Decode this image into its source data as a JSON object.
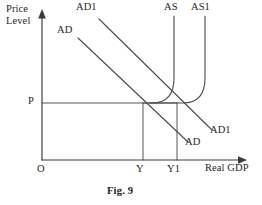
{
  "figure": {
    "caption": "Fig. 9",
    "caption_x": 106,
    "caption_y": 186,
    "width": 262,
    "height": 205,
    "background_color": "#ffffff",
    "line_color": "#4a4a4a",
    "text_color": "#262626"
  },
  "axes": {
    "y_title_line1": "Price",
    "y_title_line2": "Level",
    "y_title_x": 6,
    "y_title_y": 5,
    "x_title": "Real GDP",
    "x_title_x": 208,
    "x_title_y": 163,
    "origin_label": "O",
    "origin_label_x": 37,
    "origin_label_y": 165,
    "x_axis_y": 160,
    "y_axis_x": 42,
    "y_axis_top": 16,
    "x_axis_right": 246
  },
  "tick_labels": [
    {
      "name": "price-level-p",
      "text": "P",
      "x": 29,
      "y": 96
    },
    {
      "name": "output-y",
      "text": "Y",
      "x": 136,
      "y": 165
    },
    {
      "name": "output-y1",
      "text": "Y1",
      "x": 168,
      "y": 165
    }
  ],
  "curve_labels": [
    {
      "name": "ad1-label-top",
      "text": "AD1",
      "x": 76,
      "y": 2
    },
    {
      "name": "ad-label-top",
      "text": "AD",
      "x": 57,
      "y": 25
    },
    {
      "name": "as-label",
      "text": "AS",
      "x": 164,
      "y": 2
    },
    {
      "name": "as1-label",
      "text": "AS1",
      "x": 192,
      "y": 2
    },
    {
      "name": "ad1-label-bottom",
      "text": "AD1",
      "x": 211,
      "y": 125
    },
    {
      "name": "ad-label-bottom",
      "text": "AD",
      "x": 186,
      "y": 137
    }
  ],
  "chart_data": {
    "type": "line",
    "title": "Fig. 9",
    "xlabel": "Real GDP",
    "ylabel": "Price Level",
    "grid": false,
    "legend": false,
    "axis_ranges": {
      "x_pixel": [
        42,
        246
      ],
      "y_pixel": [
        16,
        160
      ]
    },
    "equilibria": [
      {
        "name": "initial-equilibrium",
        "label_x": "Y",
        "label_y": "P",
        "x": 143,
        "y": 103
      },
      {
        "name": "new-equilibrium",
        "label_x": "Y1",
        "label_y": "P",
        "x": 177,
        "y": 103
      }
    ],
    "series": [
      {
        "name": "AD",
        "kind": "aggregate-demand",
        "path": "M 78,38 L 188,142",
        "label_positions": [
          "top-left",
          "bottom-right"
        ]
      },
      {
        "name": "AD1",
        "kind": "aggregate-demand-shifted",
        "path": "M 99,19 L 212,130",
        "label_positions": [
          "top-left",
          "bottom-right"
        ]
      },
      {
        "name": "AS",
        "kind": "aggregate-supply",
        "path": "M 174,16 L 174,78 C 174,96 166,103 152,103 L 143,103",
        "label_positions": [
          "top"
        ]
      },
      {
        "name": "AS1",
        "kind": "aggregate-supply-shifted",
        "path": "M 205,16 L 205,78 C 205,96 197,103 183,103 L 150,103",
        "label_positions": [
          "top"
        ]
      }
    ],
    "guides": [
      {
        "name": "price-level-guide",
        "orientation": "horizontal",
        "from": [
          42,
          103
        ],
        "to": [
          177,
          103
        ],
        "value_label": "P"
      },
      {
        "name": "output-y-guide",
        "orientation": "vertical",
        "from": [
          143,
          103
        ],
        "to": [
          143,
          160
        ],
        "value_label": "Y"
      },
      {
        "name": "output-y1-guide",
        "orientation": "vertical",
        "from": [
          177,
          103
        ],
        "to": [
          177,
          160
        ],
        "value_label": "Y1"
      }
    ]
  }
}
